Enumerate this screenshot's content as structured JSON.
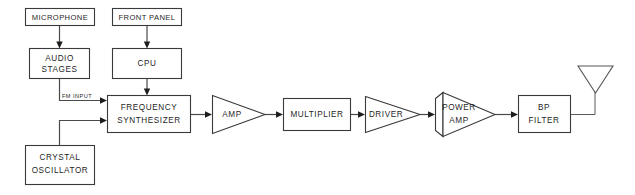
{
  "diagram": {
    "type": "block-diagram",
    "canvas": {
      "width": 635,
      "height": 195
    },
    "colors": {
      "background": "#ffffff",
      "box_stroke": "#3a3a3a",
      "wire": "#4a4a4a",
      "text": "#1f1f1f",
      "antenna_stroke": "#555555"
    },
    "blocks": [
      {
        "id": "microphone",
        "shape": "rect",
        "label": "MICROPHONE",
        "lines": [
          "MICROPHONE"
        ]
      },
      {
        "id": "front-panel",
        "shape": "rect",
        "label": "FRONT PANEL",
        "lines": [
          "FRONT PANEL"
        ]
      },
      {
        "id": "audio-stages",
        "shape": "rect",
        "label": "AUDIO STAGES",
        "lines": [
          "AUDIO",
          "STAGES"
        ]
      },
      {
        "id": "cpu",
        "shape": "rect",
        "label": "CPU",
        "lines": [
          "CPU"
        ]
      },
      {
        "id": "crystal-oscillator",
        "shape": "rect",
        "label": "CRYSTAL OSCILLATOR",
        "lines": [
          "CRYSTAL",
          "OSCILLATOR"
        ]
      },
      {
        "id": "frequency-synthesizer",
        "shape": "rect",
        "label": "FREQUENCY SYNTHESIZER",
        "lines": [
          "FREQUENCY",
          "SYNTHESIZER"
        ]
      },
      {
        "id": "amp",
        "shape": "triangle",
        "label": "AMP",
        "lines": [
          "AMP"
        ]
      },
      {
        "id": "multiplier",
        "shape": "rect",
        "label": "MULTIPLIER",
        "lines": [
          "MULTIPLIER"
        ]
      },
      {
        "id": "driver",
        "shape": "triangle",
        "label": "DRIVER",
        "lines": [
          "DRIVER"
        ]
      },
      {
        "id": "power-amp",
        "shape": "triangle",
        "label": "POWER AMP",
        "lines": [
          "POWER",
          "AMP"
        ]
      },
      {
        "id": "bp-filter",
        "shape": "rect",
        "label": "BP FILTER",
        "lines": [
          "BP",
          "FILTER"
        ]
      },
      {
        "id": "antenna",
        "shape": "antenna",
        "label": "",
        "lines": []
      }
    ],
    "wire_labels": [
      {
        "id": "fm-input",
        "text": "FM INPUT"
      }
    ],
    "connections": [
      {
        "from": "microphone",
        "to": "audio-stages"
      },
      {
        "from": "front-panel",
        "to": "cpu"
      },
      {
        "from": "audio-stages",
        "to": "frequency-synthesizer",
        "label": "FM INPUT"
      },
      {
        "from": "cpu",
        "to": "frequency-synthesizer"
      },
      {
        "from": "crystal-oscillator",
        "to": "frequency-synthesizer"
      },
      {
        "from": "frequency-synthesizer",
        "to": "amp"
      },
      {
        "from": "amp",
        "to": "multiplier"
      },
      {
        "from": "multiplier",
        "to": "driver"
      },
      {
        "from": "driver",
        "to": "power-amp"
      },
      {
        "from": "power-amp",
        "to": "bp-filter"
      },
      {
        "from": "bp-filter",
        "to": "antenna"
      }
    ],
    "labels": {
      "microphone": "MICROPHONE",
      "front_panel": "FRONT PANEL",
      "audio_1": "AUDIO",
      "audio_2": "STAGES",
      "cpu": "CPU",
      "crystal_1": "CRYSTAL",
      "crystal_2": "OSCILLATOR",
      "synth_1": "FREQUENCY",
      "synth_2": "SYNTHESIZER",
      "amp": "AMP",
      "multiplier": "MULTIPLIER",
      "driver": "DRIVER",
      "power_1": "POWER",
      "power_2": "AMP",
      "bp_1": "BP",
      "bp_2": "FILTER",
      "fm_input": "FM INPUT"
    }
  }
}
